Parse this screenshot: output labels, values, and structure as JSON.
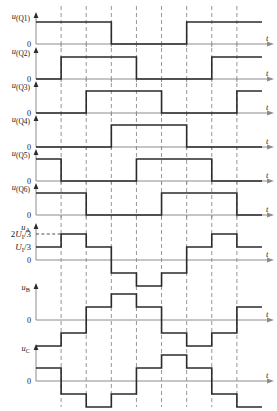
{
  "figure": {
    "type": "timing-waveform-diagram",
    "axis_label": "t",
    "zero_label": "0",
    "grid_intervals": 9,
    "period_intervals": 6
  },
  "amplitude_labels": {
    "two_thirds": {
      "coef": "2",
      "main": "U",
      "sub": "I",
      "denom": "/3"
    },
    "one_third": {
      "coef": "",
      "main": "U",
      "sub": "I",
      "denom": "/3"
    }
  },
  "chart_data": {
    "type": "line",
    "title": "",
    "xlabel": "t",
    "ylabel": "",
    "grid": true,
    "legend": "none",
    "x_interval_count": 9,
    "series": [
      {
        "name": "u(Q1)",
        "label_main": "u",
        "label_sub": "(Q1)",
        "kind": "gate",
        "ylim": [
          0,
          1
        ],
        "levels": [
          1,
          1,
          1,
          0,
          0,
          0,
          1,
          1,
          1
        ]
      },
      {
        "name": "u(Q2)",
        "label_main": "u",
        "label_sub": "(Q2)",
        "kind": "gate",
        "ylim": [
          0,
          1
        ],
        "levels": [
          0,
          1,
          1,
          1,
          0,
          0,
          0,
          1,
          1
        ]
      },
      {
        "name": "u(Q3)",
        "label_main": "u",
        "label_sub": "(Q3)",
        "kind": "gate",
        "ylim": [
          0,
          1
        ],
        "levels": [
          0,
          0,
          1,
          1,
          1,
          0,
          0,
          0,
          1
        ]
      },
      {
        "name": "u(Q4)",
        "label_main": "u",
        "label_sub": "(Q4)",
        "kind": "gate",
        "ylim": [
          0,
          1
        ],
        "levels": [
          0,
          0,
          0,
          1,
          1,
          1,
          0,
          0,
          0
        ]
      },
      {
        "name": "u(Q5)",
        "label_main": "u",
        "label_sub": "(Q5)",
        "kind": "gate",
        "ylim": [
          0,
          1
        ],
        "levels": [
          1,
          0,
          0,
          0,
          1,
          1,
          1,
          0,
          0
        ]
      },
      {
        "name": "u(Q6)",
        "label_main": "u",
        "label_sub": "(Q6)",
        "kind": "gate",
        "ylim": [
          0,
          1
        ],
        "levels": [
          1,
          1,
          0,
          0,
          0,
          1,
          1,
          1,
          0
        ]
      },
      {
        "name": "uA",
        "label_main": "u",
        "label_sub": "A",
        "kind": "phase",
        "ylim": [
          -2,
          2
        ],
        "unit": "U_I/3",
        "levels": [
          1,
          2,
          1,
          -1,
          -2,
          -1,
          1,
          2,
          1
        ]
      },
      {
        "name": "uB",
        "label_main": "u",
        "label_sub": "B",
        "kind": "phase",
        "ylim": [
          -2,
          2
        ],
        "unit": "U_I/3",
        "levels": [
          -2,
          -1,
          1,
          2,
          1,
          -1,
          -2,
          -1,
          1
        ]
      },
      {
        "name": "uC",
        "label_main": "u",
        "label_sub": "C",
        "kind": "phase",
        "ylim": [
          -2,
          2
        ],
        "unit": "U_I/3",
        "levels": [
          1,
          -1,
          -2,
          -1,
          1,
          2,
          1,
          -1,
          -2
        ]
      }
    ]
  }
}
